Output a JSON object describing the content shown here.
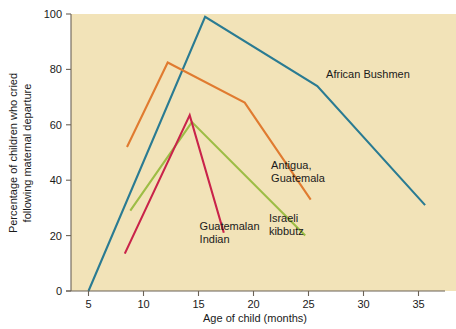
{
  "chart_data": {
    "type": "line",
    "title": "",
    "xlabel": "Age of child (months)",
    "ylabel": "Percentage of children who cried following maternal departure",
    "xlim": [
      3.5,
      37.5
    ],
    "ylim": [
      0,
      100
    ],
    "xticks": [
      5,
      10,
      15,
      20,
      25,
      30,
      35
    ],
    "yticks": [
      0,
      20,
      40,
      60,
      80,
      100
    ],
    "xtick_labels": [
      "5",
      "10",
      "15",
      "20",
      "25",
      "30",
      "35"
    ],
    "ytick_labels": [
      "0",
      "20",
      "40",
      "60",
      "80",
      "100"
    ],
    "grid": false,
    "legend": "inline-labels",
    "plot_background": "#f2e3b8",
    "series": [
      {
        "name": "African Bushmen",
        "color": "#2a7b92",
        "label": "African Bushmen",
        "label_x": 26.6,
        "label_y": 77,
        "x": [
          5.0,
          15.6,
          25.8,
          35.6
        ],
        "y": [
          0,
          99,
          74,
          31
        ]
      },
      {
        "name": "Antigua, Guatemala",
        "color": "#e07b30",
        "label_line1": "Antigua,",
        "label_line2": "Guatemala",
        "label_x": 21.6,
        "label_y": 44,
        "x": [
          8.5,
          12.2,
          19.2,
          25.2
        ],
        "y": [
          52,
          82.5,
          68,
          33
        ]
      },
      {
        "name": "Israeli kibbutz",
        "color": "#9dbd45",
        "label_line1": "Israeli",
        "label_line2": "kibbutz",
        "label_x": 21.4,
        "label_y": 25,
        "x": [
          8.8,
          14.4,
          24.7
        ],
        "y": [
          29,
          61,
          20
        ]
      },
      {
        "name": "Guatemalan Indian",
        "color": "#c9234a",
        "label_line1": "Guatemalan",
        "label_line2": "Indian",
        "label_x": 15.1,
        "label_y": 22,
        "x": [
          8.3,
          14.2,
          17.3
        ],
        "y": [
          13.5,
          63.5,
          21
        ]
      }
    ]
  }
}
